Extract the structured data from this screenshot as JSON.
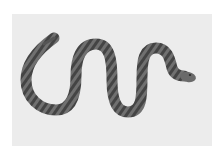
{
  "image": {
    "subject": "snake",
    "description": "Grayscale photograph of a banded snake in an S-shaped curve on a light gray background",
    "colors": {
      "page_background": "#ffffff",
      "photo_background": "#ececec",
      "snake_body": "#6e6e6e",
      "snake_bands": "#3e3e3e",
      "snake_outline": "#4a4a4a"
    }
  }
}
